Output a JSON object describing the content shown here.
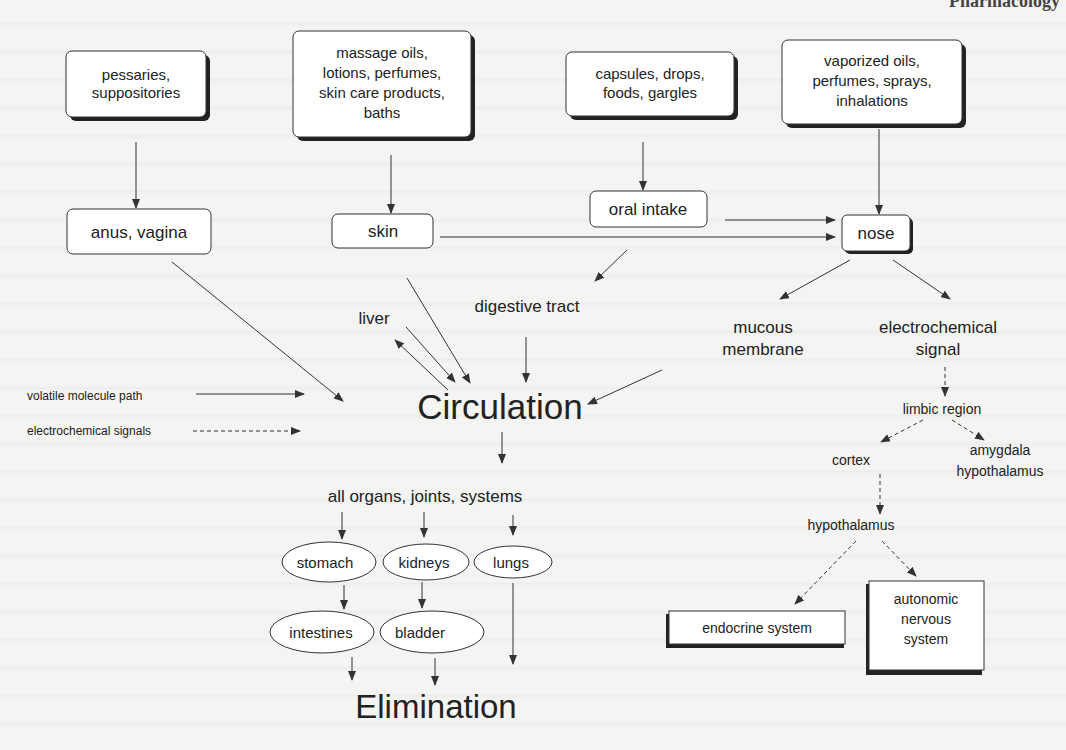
{
  "header": {
    "cut_title": "Pharmacology"
  },
  "colors": {
    "line": "#333333",
    "box_fill": "#ffffff",
    "shadow": "#222222",
    "background": "#f4f4f2"
  },
  "legend": [
    {
      "label": "volatile molecule path",
      "style": "solid"
    },
    {
      "label": "electrochemical signals",
      "style": "dashed"
    }
  ],
  "sources": [
    {
      "id": "pessaries",
      "lines": [
        "pessaries,",
        "suppositories"
      ]
    },
    {
      "id": "massage",
      "lines": [
        "massage oils,",
        "lotions, perfumes,",
        "skin care products,",
        "baths"
      ]
    },
    {
      "id": "capsules",
      "lines": [
        "capsules, drops,",
        "foods, gargles"
      ]
    },
    {
      "id": "vaporized",
      "lines": [
        "vaporized oils,",
        "perfumes, sprays,",
        "inhalations"
      ]
    }
  ],
  "entry_points": [
    {
      "id": "anus",
      "label": "anus, vagina"
    },
    {
      "id": "skin",
      "label": "skin"
    },
    {
      "id": "oral",
      "label": "oral intake"
    },
    {
      "id": "nose",
      "label": "nose"
    }
  ],
  "intermediate": {
    "liver": "liver",
    "digestive": "digestive tract",
    "mucous": [
      "mucous",
      "membrane"
    ],
    "electro": [
      "electrochemical",
      "signal"
    ]
  },
  "circulation": "Circulation",
  "all_organs": "all organs, joints, systems",
  "organs": {
    "stomach": "stomach",
    "kidneys": "kidneys",
    "lungs": "lungs",
    "intestines": "intestines",
    "bladder": "bladder"
  },
  "elimination": "Elimination",
  "brain": {
    "limbic": "limbic region",
    "cortex": "cortex",
    "amygdala": [
      "amygdala",
      "hypothalamus"
    ],
    "hypothalamus": "hypothalamus",
    "endocrine": "endocrine system",
    "autonomic": [
      "autonomic",
      "nervous",
      "system"
    ]
  }
}
